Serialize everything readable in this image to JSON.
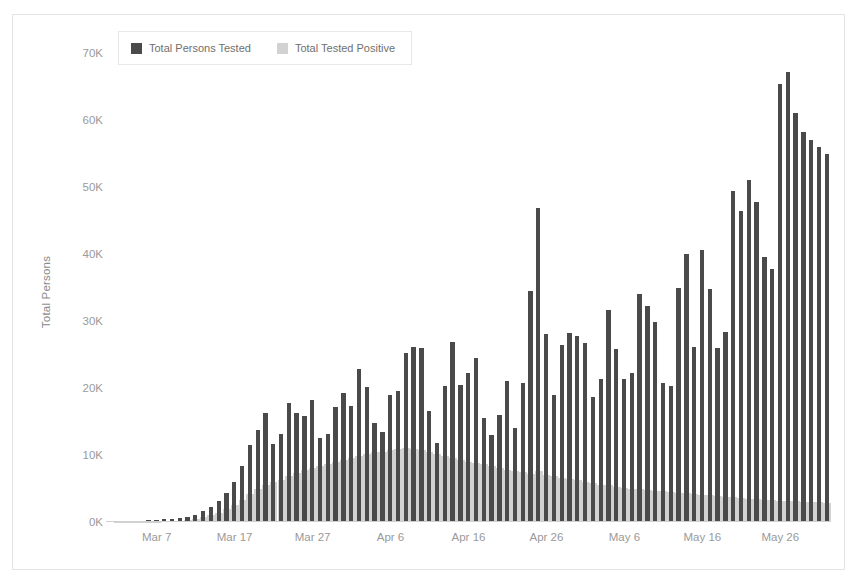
{
  "chart_data": {
    "type": "bar",
    "title": "",
    "subtitle": "",
    "xlabel": "",
    "ylabel": "Total Persons",
    "ylim": [
      0,
      73000
    ],
    "grid": false,
    "legend_position": "top-left",
    "y_ticks": [
      {
        "value": 0,
        "label": "0K"
      },
      {
        "value": 10000,
        "label": "10K"
      },
      {
        "value": 20000,
        "label": "20K"
      },
      {
        "value": 30000,
        "label": "30K"
      },
      {
        "value": 40000,
        "label": "40K"
      },
      {
        "value": 50000,
        "label": "50K"
      },
      {
        "value": 60000,
        "label": "60K"
      },
      {
        "value": 70000,
        "label": "70K"
      }
    ],
    "x_ticks": [
      {
        "index": 6,
        "label": "Mar 7"
      },
      {
        "index": 16,
        "label": "Mar 17"
      },
      {
        "index": 26,
        "label": "Mar 27"
      },
      {
        "index": 36,
        "label": "Apr 6"
      },
      {
        "index": 46,
        "label": "Apr 16"
      },
      {
        "index": 56,
        "label": "Apr 26"
      },
      {
        "index": 66,
        "label": "May 6"
      },
      {
        "index": 76,
        "label": "May 16"
      },
      {
        "index": 86,
        "label": "May 26"
      }
    ],
    "categories": [
      "Mar 1",
      "Mar 2",
      "Mar 3",
      "Mar 4",
      "Mar 5",
      "Mar 6",
      "Mar 7",
      "Mar 8",
      "Mar 9",
      "Mar 10",
      "Mar 11",
      "Mar 12",
      "Mar 13",
      "Mar 14",
      "Mar 15",
      "Mar 16",
      "Mar 17",
      "Mar 18",
      "Mar 19",
      "Mar 20",
      "Mar 21",
      "Mar 22",
      "Mar 23",
      "Mar 24",
      "Mar 25",
      "Mar 26",
      "Mar 27",
      "Mar 28",
      "Mar 29",
      "Mar 30",
      "Mar 31",
      "Apr 1",
      "Apr 2",
      "Apr 3",
      "Apr 4",
      "Apr 5",
      "Apr 6",
      "Apr 7",
      "Apr 8",
      "Apr 9",
      "Apr 10",
      "Apr 11",
      "Apr 12",
      "Apr 13",
      "Apr 14",
      "Apr 15",
      "Apr 16",
      "Apr 17",
      "Apr 18",
      "Apr 19",
      "Apr 20",
      "Apr 21",
      "Apr 22",
      "Apr 23",
      "Apr 24",
      "Apr 25",
      "Apr 26",
      "Apr 27",
      "Apr 28",
      "Apr 29",
      "Apr 30",
      "May 1",
      "May 2",
      "May 3",
      "May 4",
      "May 5",
      "May 6",
      "May 7",
      "May 8",
      "May 9",
      "May 10",
      "May 11",
      "May 12",
      "May 13",
      "May 14",
      "May 15",
      "May 16",
      "May 17",
      "May 18",
      "May 19",
      "May 20",
      "May 21",
      "May 22",
      "May 23",
      "May 24",
      "May 25",
      "May 26",
      "May 27",
      "May 28",
      "May 29",
      "May 30",
      "May 31",
      "Jun 1"
    ],
    "series": [
      {
        "name": "Total Persons Tested",
        "color": "#4a4a4a",
        "values": [
          100,
          120,
          150,
          180,
          200,
          240,
          300,
          380,
          450,
          600,
          800,
          1100,
          1600,
          2300,
          3200,
          4400,
          6000,
          8400,
          11500,
          13800,
          16300,
          11700,
          13100,
          17700,
          16200,
          15900,
          18200,
          12500,
          13200,
          17100,
          19200,
          17300,
          22800,
          20200,
          14800,
          13400,
          18900,
          19500,
          25200,
          26100,
          26000,
          16500,
          11800,
          20300,
          26800,
          20400,
          22200,
          24500,
          15500,
          13000,
          16000,
          21000,
          14100,
          20800,
          34500,
          46900,
          28000,
          18900,
          26500,
          28200,
          27800,
          26700,
          18700,
          21300,
          31600,
          25800,
          21400,
          22200,
          34100,
          32200,
          29800,
          20800,
          20300,
          35000,
          40000,
          26100,
          40600,
          34800,
          26000,
          28300,
          49400,
          46500,
          51100,
          47800,
          39500,
          37800,
          65400,
          67200,
          61000,
          58200,
          57000,
          56000,
          55000
        ]
      },
      {
        "name": "Total Tested Positive",
        "color": "#d2d2d2",
        "values": [
          10,
          15,
          20,
          25,
          35,
          45,
          60,
          90,
          130,
          200,
          300,
          450,
          700,
          1000,
          1400,
          1900,
          2500,
          3300,
          4200,
          5000,
          5600,
          5900,
          6300,
          6900,
          7300,
          7700,
          8100,
          8400,
          8700,
          9000,
          9300,
          9600,
          9900,
          10200,
          10400,
          10500,
          10800,
          10900,
          11000,
          10900,
          10700,
          10400,
          10100,
          9800,
          9600,
          9300,
          9000,
          8800,
          8600,
          8300,
          8000,
          7800,
          7600,
          7400,
          7200,
          7600,
          7000,
          6800,
          6600,
          6400,
          6200,
          6000,
          5800,
          5600,
          5500,
          5300,
          5100,
          5000,
          4900,
          4800,
          4700,
          4600,
          4500,
          4400,
          4300,
          4200,
          4100,
          4000,
          3900,
          3800,
          3700,
          3600,
          3500,
          3400,
          3300,
          3250,
          3200,
          3150,
          3100,
          3050,
          3000,
          2950,
          2900
        ]
      }
    ]
  },
  "legend": {
    "items": [
      {
        "label": "Total Persons Tested",
        "color": "#4a4a4a"
      },
      {
        "label": "Total Tested Positive",
        "color": "#d2d2d2"
      }
    ]
  },
  "axes": {
    "y_title": "Total Persons"
  }
}
